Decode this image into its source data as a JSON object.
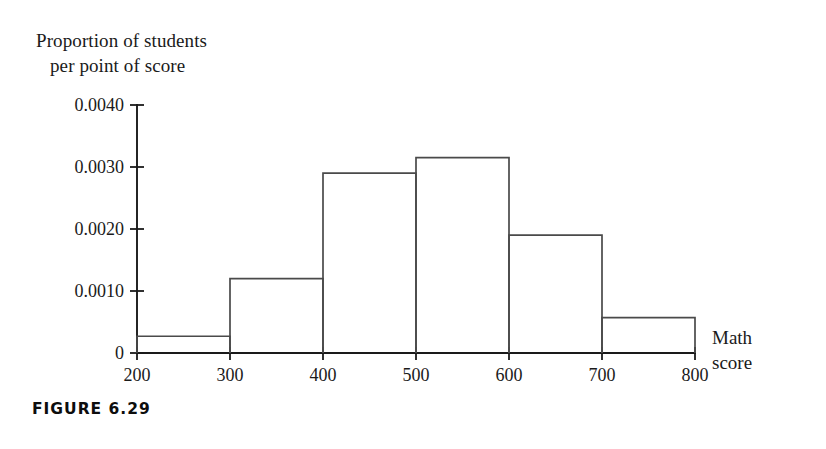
{
  "chart_data": {
    "type": "bar",
    "title": "",
    "ylabel_line1": "Proportion of students",
    "ylabel_line2": "per point of score",
    "xlabel_line1": "Math",
    "xlabel_line2": "score",
    "categories": [
      "200-300",
      "300-400",
      "400-500",
      "500-600",
      "600-700",
      "700-800"
    ],
    "bin_edges": [
      200,
      300,
      400,
      500,
      600,
      700,
      800
    ],
    "values": [
      0.00027,
      0.0012,
      0.0029,
      0.00315,
      0.0019,
      0.00057
    ],
    "xlim": [
      200,
      800
    ],
    "ylim": [
      0,
      0.004
    ],
    "xticks": [
      200,
      300,
      400,
      500,
      600,
      700,
      800
    ],
    "xtick_labels": [
      "200",
      "300",
      "400",
      "500",
      "600",
      "700",
      "800"
    ],
    "yticks": [
      0,
      0.001,
      0.002,
      0.003,
      0.004
    ],
    "ytick_labels": [
      "0",
      "0.0010",
      "0.0020",
      "0.0030",
      "0.0040"
    ],
    "grid": false,
    "legend": false,
    "bar_fill": "#ffffff",
    "bar_stroke": "#4a4a4a",
    "axis_color": "#1a1a1a",
    "background": "#ffffff"
  },
  "caption": {
    "label": "FIGURE 6.29"
  }
}
